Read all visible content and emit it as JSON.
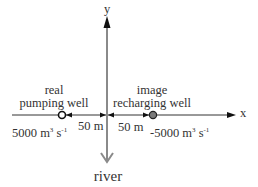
{
  "axes": {
    "x_label": "x",
    "y_label": "y"
  },
  "river": {
    "label": "river"
  },
  "real_well": {
    "label_line1": "real",
    "label_line2": "pumping well",
    "rate_value": "5000 m",
    "rate_exp1": "3",
    "rate_unit": " s",
    "rate_exp2": "-1",
    "distance": "50 m"
  },
  "image_well": {
    "label_line1": "image",
    "label_line2": "recharging well",
    "rate_value": "-5000 m",
    "rate_exp1": "3",
    "rate_unit": " s",
    "rate_exp2": "-1",
    "distance": "50 m"
  },
  "colors": {
    "axis": "#1a1a1a",
    "river_axis": "#8a8a8a",
    "image_well_fill": "#7a7a7a",
    "real_well_fill": "#ffffff"
  }
}
